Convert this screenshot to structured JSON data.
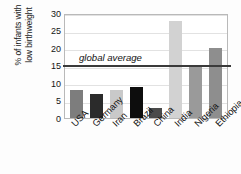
{
  "chart_data": {
    "type": "bar",
    "title": "",
    "xlabel": "",
    "ylabel": "% of infants with low birthweight",
    "ylabel_line1": "% of infants with",
    "ylabel_line2": "low birthweight",
    "categories": [
      "USA",
      "Germany",
      "Iran",
      "Brazil",
      "China",
      "India",
      "Nigeria",
      "Ethiopia"
    ],
    "values": [
      8,
      7,
      8,
      9,
      3,
      27.7,
      15,
      20
    ],
    "bar_colors": [
      "#7d7d7d",
      "#2b2b2b",
      "#c9c9c9",
      "#0d0d0d",
      "#4a4a4a",
      "#d2d2d2",
      "#9a9a9a",
      "#8e8e8e"
    ],
    "ylim": [
      0,
      30
    ],
    "yticks": [
      30,
      25,
      20,
      15,
      10,
      5,
      0
    ],
    "ytick_labels": [
      "30",
      "25",
      "20",
      "15",
      "10",
      "5",
      "0"
    ],
    "grid": true,
    "legend": "none",
    "annotations": [
      {
        "name": "global-average",
        "label": "global average",
        "value": 15.7,
        "style": "italic",
        "line_color": "#3a3a3a"
      }
    ]
  }
}
